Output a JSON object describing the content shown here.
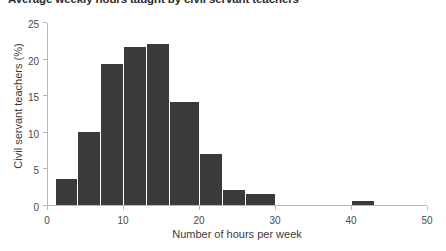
{
  "chart_data": {
    "type": "bar",
    "title": "Average weekly hours taught by civil servant teachers",
    "xlabel": "Number of hours per week",
    "ylabel": "Civil servant teachers (%)",
    "xlim": [
      0,
      50
    ],
    "ylim": [
      0,
      25
    ],
    "xticks": [
      0,
      10,
      20,
      30,
      40,
      50
    ],
    "xtick_labels": [
      "0",
      "10",
      "20",
      "30",
      "40",
      "50"
    ],
    "yticks": [
      0,
      5,
      10,
      15,
      20,
      25
    ],
    "ytick_labels": [
      "0",
      "5",
      "10",
      "15",
      "20",
      "25"
    ],
    "grid": false,
    "legend": null,
    "bin_width": 3,
    "bar_color": "#3a3a3a",
    "bins": [
      {
        "start": 1,
        "end": 4,
        "value": 3.6
      },
      {
        "start": 4,
        "end": 7,
        "value": 10.0
      },
      {
        "start": 7,
        "end": 10,
        "value": 19.2
      },
      {
        "start": 10,
        "end": 13,
        "value": 21.6
      },
      {
        "start": 13,
        "end": 16,
        "value": 22.0
      },
      {
        "start": 16,
        "end": 20,
        "value": 14.1
      },
      {
        "start": 20,
        "end": 23,
        "value": 7.0
      },
      {
        "start": 23,
        "end": 26,
        "value": 2.0
      },
      {
        "start": 26,
        "end": 30,
        "value": 1.5
      },
      {
        "start": 40,
        "end": 43,
        "value": 0.6
      }
    ],
    "categories": [
      "1-4",
      "4-7",
      "7-10",
      "10-13",
      "13-16",
      "16-20",
      "20-23",
      "23-26",
      "26-30",
      "40-43"
    ],
    "values": [
      3.6,
      10.0,
      19.2,
      21.6,
      22.0,
      14.1,
      7.0,
      2.0,
      1.5,
      0.6
    ]
  }
}
